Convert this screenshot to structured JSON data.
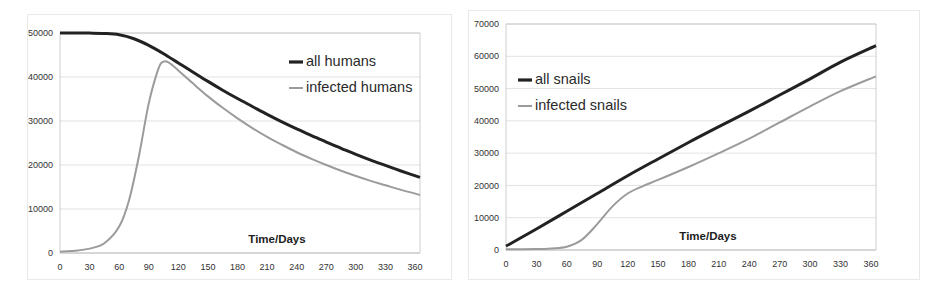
{
  "figure": {
    "title": "",
    "panel_count": 2
  },
  "chart_data": [
    {
      "id": "humans-panel",
      "type": "line",
      "title": "",
      "xlabel": "Time/Days",
      "ylabel": "",
      "xlim": [
        0,
        365
      ],
      "ylim": [
        0,
        50000
      ],
      "grid": true,
      "legend_position": "upper-right",
      "xticks": [
        0,
        30,
        60,
        90,
        120,
        150,
        180,
        210,
        240,
        270,
        300,
        330,
        360
      ],
      "xticklabels": [
        "0",
        "30",
        "60",
        "90",
        "120",
        "150",
        "180",
        "210",
        "240",
        "270",
        "300",
        "330",
        "360"
      ],
      "yticks": [
        0,
        10000,
        20000,
        30000,
        40000,
        50000
      ],
      "yticklabels": [
        "0",
        "10000",
        "20000",
        "30000",
        "40000",
        "50000"
      ],
      "series": [
        {
          "name": "all humans",
          "color": "#222222",
          "style": "solid-thick",
          "x": [
            0,
            15,
            30,
            45,
            60,
            75,
            90,
            105,
            120,
            135,
            150,
            165,
            180,
            195,
            210,
            225,
            240,
            255,
            270,
            285,
            300,
            315,
            330,
            345,
            365
          ],
          "values": [
            50000,
            50000,
            49980,
            49900,
            49600,
            48700,
            47200,
            45300,
            43200,
            41100,
            39000,
            37000,
            35100,
            33300,
            31500,
            29800,
            28200,
            26700,
            25200,
            23800,
            22400,
            21100,
            19900,
            18700,
            17200
          ]
        },
        {
          "name": "infected humans",
          "color": "#9b9b9b",
          "style": "solid-thin",
          "x": [
            0,
            15,
            30,
            45,
            60,
            70,
            80,
            90,
            100,
            105,
            110,
            120,
            135,
            150,
            165,
            180,
            195,
            210,
            225,
            240,
            255,
            270,
            285,
            300,
            315,
            330,
            345,
            365
          ],
          "values": [
            300,
            500,
            1000,
            2200,
            6000,
            12000,
            22000,
            34000,
            42000,
            43500,
            43300,
            41500,
            38500,
            35600,
            33000,
            30600,
            28400,
            26400,
            24600,
            22900,
            21400,
            20000,
            18700,
            17500,
            16400,
            15400,
            14400,
            13200
          ]
        }
      ]
    },
    {
      "id": "snails-panel",
      "type": "line",
      "title": "",
      "xlabel": "Time/Days",
      "ylabel": "",
      "xlim": [
        0,
        365
      ],
      "ylim": [
        0,
        70000
      ],
      "grid": true,
      "legend_position": "upper-left",
      "xticks": [
        0,
        30,
        60,
        90,
        120,
        150,
        180,
        210,
        240,
        270,
        300,
        330,
        360
      ],
      "xticklabels": [
        "0",
        "30",
        "60",
        "90",
        "120",
        "150",
        "180",
        "210",
        "240",
        "270",
        "300",
        "330",
        "360"
      ],
      "yticks": [
        0,
        10000,
        20000,
        30000,
        40000,
        50000,
        60000,
        70000
      ],
      "yticklabels": [
        "0",
        "10000",
        "20000",
        "30000",
        "40000",
        "50000",
        "60000",
        "70000"
      ],
      "series": [
        {
          "name": "all snails",
          "color": "#222222",
          "style": "solid-thick",
          "x": [
            0,
            30,
            60,
            90,
            120,
            150,
            180,
            210,
            240,
            270,
            300,
            330,
            365
          ],
          "values": [
            1200,
            6500,
            12000,
            17500,
            23000,
            28200,
            33300,
            38200,
            43000,
            48000,
            53000,
            58200,
            63300
          ]
        },
        {
          "name": "infected snails",
          "color": "#9b9b9b",
          "style": "solid-thin",
          "x": [
            0,
            30,
            45,
            60,
            75,
            90,
            105,
            120,
            135,
            150,
            180,
            210,
            240,
            270,
            300,
            330,
            365
          ],
          "values": [
            200,
            300,
            500,
            1000,
            3200,
            8000,
            13500,
            17500,
            19800,
            21700,
            25700,
            30000,
            34500,
            39500,
            44500,
            49200,
            53800
          ]
        }
      ]
    }
  ],
  "panels": [
    {
      "legend": [
        {
          "label": "all humans",
          "marker": "line-thick-dark"
        },
        {
          "label": "infected humans",
          "marker": "line-thin-gray"
        }
      ],
      "xaxis_title": "Time/Days"
    },
    {
      "legend": [
        {
          "label": "all snails",
          "marker": "line-thick-dark"
        },
        {
          "label": "infected snails",
          "marker": "line-thin-gray"
        }
      ],
      "xaxis_title": "Time/Days"
    }
  ]
}
